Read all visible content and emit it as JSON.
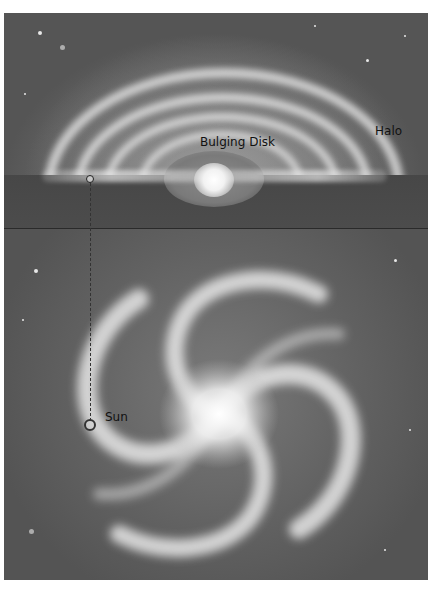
{
  "figure": {
    "palette": {
      "background": "#5e5e5e",
      "glow": "#f2f2f2",
      "label_text": "#111111",
      "frame_border": "#ffffff"
    }
  },
  "edge_on_view": {
    "labels": {
      "bulge": "Bulging Disk",
      "halo": "Halo"
    },
    "components": [
      "halo",
      "spiral-arms",
      "galactic-disk",
      "central-bulge",
      "sun-position-marker"
    ]
  },
  "face_on_view": {
    "labels": {
      "sun": "Sun"
    },
    "components": [
      "spiral-arms",
      "galactic-core",
      "sun-position-marker",
      "projection-dashed-line"
    ]
  }
}
